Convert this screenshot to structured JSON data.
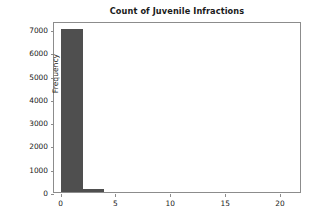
{
  "chart_data": {
    "type": "bar",
    "title": "Count of Juvenile Infractions",
    "xlabel": "",
    "ylabel": "Frequency",
    "xlim": [
      -0.6,
      22.0
    ],
    "ylim": [
      0,
      7350
    ],
    "grid": false,
    "legend": null,
    "bin_edges": [
      0,
      2,
      4
    ],
    "bar_color": "#4f4f4f",
    "bars": [
      {
        "x_start": 0,
        "x_end": 2,
        "value": 6990
      },
      {
        "x_start": 2,
        "x_end": 4,
        "value": 150
      }
    ],
    "categories": [
      "0-2",
      "2-4"
    ],
    "values": [
      6990,
      150
    ],
    "x_ticks": [
      {
        "value": 0,
        "label": "0"
      },
      {
        "value": 5,
        "label": "5"
      },
      {
        "value": 10,
        "label": "10"
      },
      {
        "value": 15,
        "label": "15"
      },
      {
        "value": 20,
        "label": "20"
      }
    ],
    "y_ticks": [
      {
        "value": 0,
        "label": "0"
      },
      {
        "value": 1000,
        "label": "1000"
      },
      {
        "value": 2000,
        "label": "2000"
      },
      {
        "value": 3000,
        "label": "3000"
      },
      {
        "value": 4000,
        "label": "4000"
      },
      {
        "value": 5000,
        "label": "5000"
      },
      {
        "value": 6000,
        "label": "6000"
      },
      {
        "value": 7000,
        "label": "7000"
      }
    ]
  }
}
